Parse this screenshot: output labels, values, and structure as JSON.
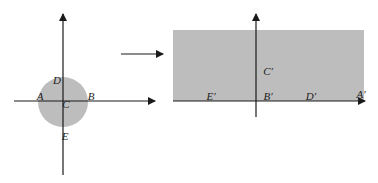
{
  "colors": {
    "shape_fill": "#bdbdbd",
    "axis": "#1a1a1a",
    "background": "#ffffff"
  },
  "left_figure": {
    "description": "disk centered at origin on coordinate axes",
    "labels": {
      "A": "A",
      "B": "B",
      "C": "C",
      "D": "D",
      "E": "E"
    }
  },
  "transform_arrow": {
    "direction": "right"
  },
  "right_figure": {
    "description": "rectangle strip above horizontal axis",
    "labels": {
      "A": "A′",
      "B": "B′",
      "C": "C′",
      "D": "D′",
      "E": "E′"
    }
  }
}
